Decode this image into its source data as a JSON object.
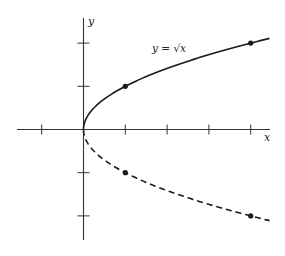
{
  "chart_data": {
    "type": "line",
    "title": "",
    "xlabel": "x",
    "ylabel": "y",
    "equation_label": "y = √x",
    "x_ticks": [
      -1,
      1,
      2,
      3,
      4
    ],
    "y_ticks": [
      -2,
      -1,
      1,
      2
    ],
    "xlim": [
      -1.6,
      4.45
    ],
    "ylim": [
      -2.6,
      2.6
    ],
    "grid": false,
    "series": [
      {
        "name": "y = √x",
        "style": "solid",
        "function": "sqrt",
        "x_range": [
          0,
          4.45
        ],
        "marked_points": [
          [
            1,
            1
          ],
          [
            4,
            2
          ]
        ]
      },
      {
        "name": "y = -√x",
        "style": "dashed",
        "function": "neg_sqrt",
        "x_range": [
          0,
          4.45
        ],
        "marked_points": [
          [
            1,
            -1
          ],
          [
            4,
            -2
          ]
        ]
      }
    ]
  },
  "layout": {
    "origin_px": [
      83.5,
      129.5
    ],
    "x_unit_px": 41.8,
    "y_unit_px": 43.2,
    "x_axis_px": [
      17,
      270
    ],
    "y_axis_px": [
      18,
      240
    ],
    "line_color": "#1a1a1a",
    "axis_color": "#333333"
  },
  "labels": {
    "x_axis": "x",
    "y_axis": "y",
    "equation": "y = √x"
  }
}
